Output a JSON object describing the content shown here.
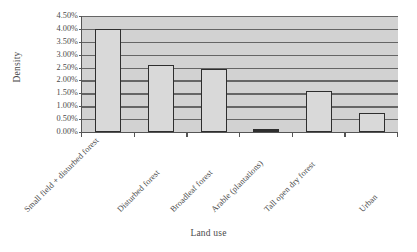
{
  "chart_data": {
    "type": "bar",
    "title": "",
    "xlabel": "Land use",
    "ylabel": "Density",
    "categories": [
      "Small field + disturbed forest",
      "Disturbed forest",
      "Broadleaf forest",
      "Arable (plantations)",
      "Tall open dry forest",
      "Urban"
    ],
    "values": [
      4.0,
      2.6,
      2.45,
      0.04,
      1.6,
      0.75
    ],
    "value_unit": "%",
    "ylim": [
      0,
      4.5
    ],
    "ytick_values": [
      0.0,
      0.5,
      1.0,
      1.5,
      2.0,
      2.5,
      3.0,
      3.5,
      4.0,
      4.5
    ],
    "ytick_labels": [
      "0.00%",
      "0.50%",
      "1.00%",
      "1.50%",
      "2.00%",
      "2.50%",
      "3.00%",
      "3.50%",
      "4.00%",
      "4.50%"
    ],
    "grid": true,
    "legend": false,
    "series": [
      {
        "name": "Density",
        "values": [
          4.0,
          2.6,
          2.45,
          0.04,
          1.6,
          0.75
        ]
      }
    ],
    "colors": {
      "bar_fill": "#d9d9d9",
      "bar_edge": "#2e2e2e",
      "plot_background": "#d2d2d2",
      "gridline": "#656565",
      "axis": "#555555",
      "text": "#4a4a4a"
    }
  }
}
